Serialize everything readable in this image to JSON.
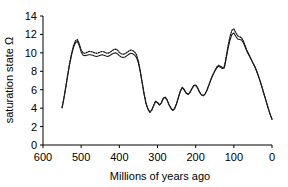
{
  "chart_data": {
    "type": "line",
    "title": "",
    "xlabel": "Millions of years ago",
    "ylabel": "saturation state Ω",
    "xlim": [
      600,
      0
    ],
    "ylim": [
      0,
      14
    ],
    "x_reversed": true,
    "grid": false,
    "legend": "none",
    "xticks": [
      600,
      500,
      400,
      300,
      200,
      100,
      0
    ],
    "xtick_labels": [
      "600",
      "500",
      "400",
      "300",
      "200",
      "100",
      "0"
    ],
    "yticks": [
      0,
      2,
      4,
      6,
      8,
      10,
      12,
      14
    ],
    "ytick_labels": [
      "0",
      "2",
      "4",
      "6",
      "8",
      "10",
      "12",
      "14"
    ],
    "x": [
      550,
      545,
      540,
      535,
      530,
      525,
      520,
      515,
      510,
      505,
      500,
      495,
      490,
      485,
      480,
      475,
      470,
      465,
      460,
      455,
      450,
      445,
      440,
      435,
      430,
      425,
      420,
      415,
      410,
      405,
      400,
      395,
      390,
      385,
      380,
      375,
      370,
      365,
      360,
      355,
      350,
      345,
      340,
      335,
      330,
      325,
      320,
      315,
      310,
      305,
      300,
      295,
      290,
      285,
      280,
      275,
      270,
      265,
      260,
      255,
      250,
      245,
      240,
      235,
      230,
      225,
      220,
      215,
      210,
      205,
      200,
      195,
      190,
      185,
      180,
      175,
      170,
      165,
      160,
      155,
      150,
      145,
      140,
      135,
      130,
      125,
      120,
      115,
      110,
      105,
      100,
      95,
      90,
      85,
      80,
      75,
      70,
      65,
      60,
      55,
      50,
      45,
      40,
      35,
      30,
      25,
      20,
      15,
      10,
      5,
      0
    ],
    "series": [
      {
        "name": "solid-curve",
        "style": "solid",
        "values": [
          4.05,
          5.1,
          6.3,
          7.6,
          8.8,
          9.8,
          10.6,
          11.1,
          11.25,
          10.8,
          10.1,
          9.75,
          9.7,
          9.75,
          9.8,
          9.8,
          9.75,
          9.65,
          9.6,
          9.65,
          9.75,
          9.8,
          9.75,
          9.65,
          9.6,
          9.7,
          9.85,
          9.95,
          10.0,
          9.9,
          9.7,
          9.55,
          9.5,
          9.55,
          9.7,
          9.85,
          9.95,
          9.9,
          9.75,
          9.5,
          8.9,
          7.9,
          6.7,
          5.5,
          4.5,
          3.9,
          3.55,
          3.8,
          4.3,
          4.75,
          4.6,
          4.35,
          4.55,
          5.05,
          5.2,
          4.9,
          4.4,
          4.0,
          3.75,
          3.95,
          4.5,
          5.2,
          5.85,
          6.25,
          6.0,
          5.65,
          5.5,
          5.7,
          6.1,
          6.45,
          6.5,
          6.2,
          5.75,
          5.45,
          5.35,
          5.55,
          6.0,
          6.55,
          7.1,
          7.6,
          8.0,
          8.35,
          8.55,
          8.45,
          8.3,
          8.35,
          9.4,
          10.5,
          11.4,
          12.0,
          12.15,
          11.8,
          11.5,
          11.45,
          11.4,
          11.1,
          10.6,
          10.1,
          9.7,
          9.3,
          8.9,
          8.5,
          8.0,
          7.4,
          6.8,
          6.1,
          5.4,
          4.7,
          4.0,
          3.35,
          2.8
        ]
      },
      {
        "name": "dotted-curve",
        "style": "dotted",
        "values": [
          4.05,
          5.15,
          6.4,
          7.7,
          8.95,
          9.95,
          10.8,
          11.3,
          11.45,
          11.0,
          10.3,
          10.0,
          9.95,
          10.05,
          10.15,
          10.15,
          10.1,
          10.0,
          9.95,
          10.0,
          10.1,
          10.15,
          10.1,
          10.0,
          9.95,
          10.05,
          10.2,
          10.35,
          10.4,
          10.3,
          10.05,
          9.9,
          9.85,
          9.9,
          10.05,
          10.2,
          10.3,
          10.25,
          10.1,
          9.8,
          9.1,
          8.0,
          6.75,
          5.55,
          4.5,
          3.9,
          3.55,
          3.8,
          4.3,
          4.75,
          4.6,
          4.35,
          4.55,
          5.05,
          5.2,
          4.9,
          4.4,
          4.0,
          3.75,
          3.95,
          4.5,
          5.2,
          5.85,
          6.25,
          6.0,
          5.65,
          5.5,
          5.7,
          6.1,
          6.45,
          6.5,
          6.2,
          5.75,
          5.45,
          5.35,
          5.55,
          6.0,
          6.55,
          7.1,
          7.6,
          8.05,
          8.45,
          8.65,
          8.55,
          8.4,
          8.45,
          9.6,
          10.8,
          11.8,
          12.45,
          12.6,
          12.2,
          11.85,
          11.75,
          11.65,
          11.3,
          10.75,
          10.2,
          9.8,
          9.35,
          8.9,
          8.5,
          8.0,
          7.4,
          6.8,
          6.1,
          5.4,
          4.7,
          4.0,
          3.35,
          2.8
        ]
      }
    ]
  },
  "colors": {
    "axis": "#000000",
    "line": "#1a1a1a",
    "background": "#ffffff"
  }
}
